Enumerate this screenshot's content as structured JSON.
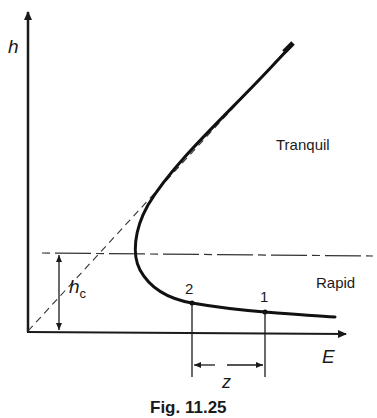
{
  "diagram": {
    "type": "specific-energy-curve",
    "axes": {
      "y_label": "h",
      "x_label": "E"
    },
    "critical_depth_label": "h",
    "critical_depth_subscript": "c",
    "regions": {
      "upper": "Tranquil",
      "lower": "Rapid"
    },
    "points": [
      {
        "id": "2",
        "label": "2"
      },
      {
        "id": "1",
        "label": "1"
      }
    ],
    "dimension_label": "z",
    "caption": "Fig. 11.25",
    "colors": {
      "ink": "#1a1a1a",
      "background": "#ffffff"
    }
  }
}
